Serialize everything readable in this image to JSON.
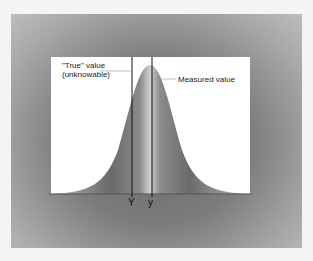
{
  "diagram": {
    "title": "",
    "labels": {
      "true_value_line1": "\"True\" value",
      "true_value_line2": "(unknowable)",
      "measured_value": "Measured value",
      "true_axis": "Y",
      "measured_axis": "y"
    },
    "colors": {
      "background": "#f4f4f4",
      "frame": "#7c7c7c",
      "plot_bg": "#ffffff",
      "curve_fill": "#6e6e6e",
      "line": "#111111"
    }
  }
}
